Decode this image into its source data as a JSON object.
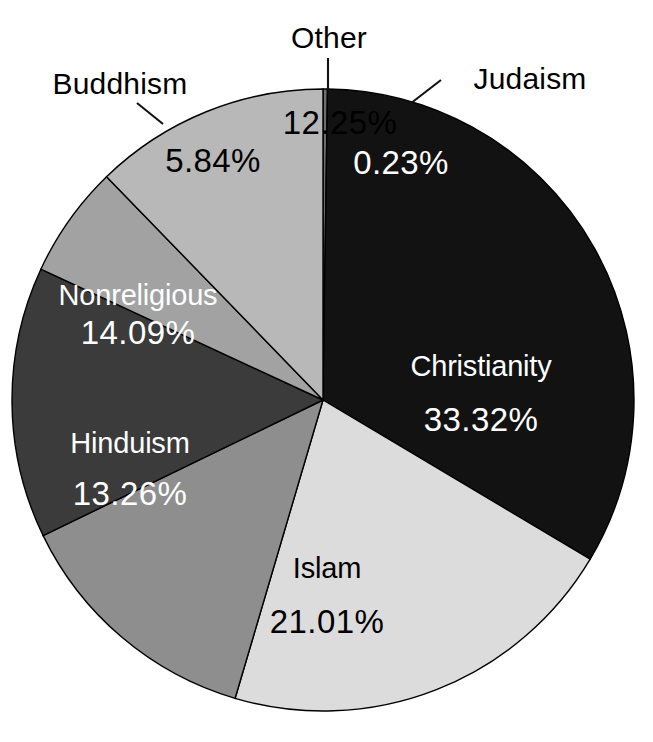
{
  "chart_data": {
    "type": "pie",
    "title": "",
    "subtitle": "",
    "xlabel": "",
    "ylabel": "",
    "legend_position": "none",
    "grid": false,
    "units": "percent",
    "total": 100.0,
    "start_angle_deg": 0,
    "direction": "clockwise",
    "categories": [
      "Judaism",
      "Christianity",
      "Islam",
      "Hinduism",
      "Nonreligious",
      "Buddhism",
      "Other"
    ],
    "values": [
      0.23,
      33.32,
      21.01,
      13.26,
      14.09,
      5.84,
      12.25
    ],
    "slices": [
      {
        "name": "Judaism",
        "value": 0.23,
        "value_label": "0.23%",
        "fill": "#6e6e6e",
        "text_color": "#ffffff",
        "label_placement": "callout",
        "name_x": 530,
        "name_y": 79,
        "value_x": 401,
        "value_y": 163,
        "leader": {
          "x1": 406,
          "y1": 107,
          "x2": 441,
          "y2": 80
        }
      },
      {
        "name": "Christianity",
        "value": 33.32,
        "value_label": "33.32%",
        "fill": "#121212",
        "text_color": "#ffffff",
        "label_placement": "inside",
        "name_x": 481,
        "name_y": 366,
        "value_x": 481,
        "value_y": 420
      },
      {
        "name": "Islam",
        "value": 21.01,
        "value_label": "21.01%",
        "fill": "#dcdcdc",
        "text_color": "#000000",
        "label_placement": "inside",
        "name_x": 327,
        "name_y": 568,
        "value_x": 327,
        "value_y": 622
      },
      {
        "name": "Hinduism",
        "value": 13.26,
        "value_label": "13.26%",
        "fill": "#8e8e8e",
        "text_color": "#ffffff",
        "label_placement": "inside",
        "name_x": 130,
        "name_y": 443,
        "value_x": 130,
        "value_y": 494
      },
      {
        "name": "Nonreligious",
        "value": 14.09,
        "value_label": "14.09%",
        "fill": "#3b3b3b",
        "text_color": "#ffffff",
        "label_placement": "inside",
        "name_x": 138,
        "name_y": 295,
        "value_x": 138,
        "value_y": 333
      },
      {
        "name": "Buddhism",
        "value": 5.84,
        "value_label": "5.84%",
        "fill": "#a2a2a2",
        "text_color": "#000000",
        "label_placement": "callout",
        "name_x": 120,
        "name_y": 84,
        "value_x": 213,
        "value_y": 161,
        "leader": {
          "x1": 163,
          "y1": 124,
          "x2": 137,
          "y2": 103
        }
      },
      {
        "name": "Other",
        "value": 12.25,
        "value_label": "12.25%",
        "fill": "#b8b8b8",
        "text_color": "#000000",
        "label_placement": "callout",
        "name_x": 329,
        "name_y": 38,
        "value_x": 340,
        "value_y": 123,
        "leader": {
          "x1": 328,
          "y1": 58,
          "x2": 328,
          "y2": 90
        }
      }
    ],
    "geometry": {
      "center_x": 323,
      "center_y": 400,
      "radius": 311
    },
    "colors": {
      "background": "#ffffff",
      "outline": "#000000",
      "label_dark": "#000000",
      "label_light": "#ffffff"
    }
  }
}
